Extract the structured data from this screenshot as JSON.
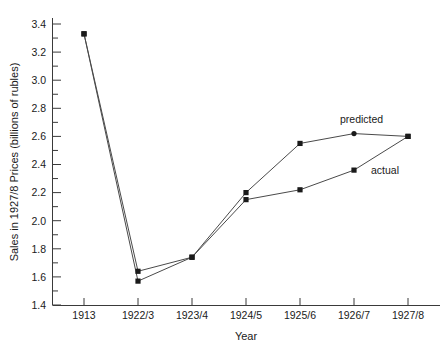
{
  "chart_data": {
    "type": "line",
    "title": "",
    "xlabel": "Year",
    "ylabel": "Sales in 1927/8 Prices (billions of rubles)",
    "categories": [
      "1913",
      "1922/3",
      "1923/4",
      "1924/5",
      "1925/6",
      "1926/7",
      "1927/8"
    ],
    "series": [
      {
        "name": "predicted",
        "values": [
          3.33,
          1.64,
          1.74,
          2.2,
          2.55,
          2.62,
          2.6
        ],
        "marker": "square-and-dot"
      },
      {
        "name": "actual",
        "values": [
          3.33,
          1.57,
          1.74,
          2.15,
          2.22,
          2.36,
          2.6
        ],
        "marker": "square"
      }
    ],
    "ylim": [
      1.4,
      3.4
    ],
    "ytick_labels": [
      "1.4",
      "1.6",
      "1.8",
      "2.0",
      "2.2",
      "2.4",
      "2.6",
      "2.8",
      "3.0",
      "3.2",
      "3.4"
    ],
    "ytick_values": [
      1.4,
      1.6,
      1.8,
      2.0,
      2.2,
      2.4,
      2.6,
      2.8,
      3.0,
      3.2,
      3.4
    ],
    "minor_ticks": true,
    "grid": false,
    "legend_position": "inline-annotations",
    "annotations": [
      {
        "text": "predicted",
        "x_category": "1926/7",
        "y_value": 2.82
      },
      {
        "text": "actual",
        "x_category": "1927/8",
        "y_value": 2.4
      }
    ],
    "line_color": "#4a4a4a",
    "marker_color": "#1a1a1a",
    "axis_color": "#3a3a3a",
    "background_color": "#ffffff"
  }
}
